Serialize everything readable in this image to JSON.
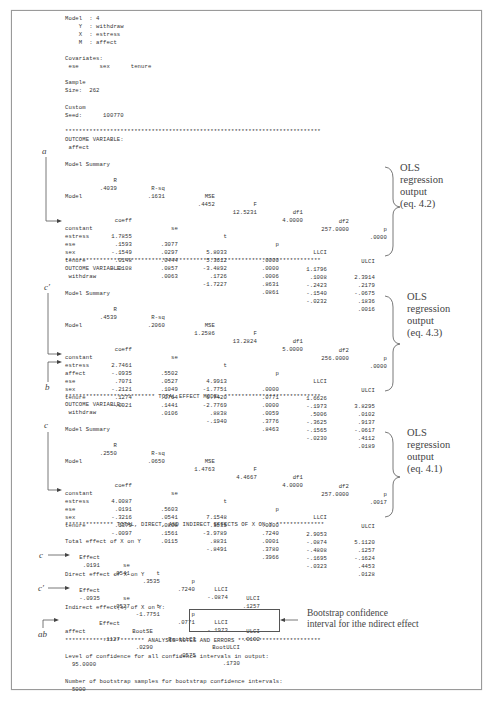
{
  "header": {
    "model_line": "Model  : 4",
    "y_line": "    Y  : withdraw",
    "x_line": "    X  : estress",
    "m_line": "    M  : affect",
    "covariates_label": "Covariates:",
    "covariates": " ese      sex      tenure",
    "sample_label": "Sample",
    "size_line": "Size:  262",
    "custom_label": "Custom",
    "seed_line": "Seed:      100770"
  },
  "stars_plain": "**************************************************************************",
  "outcome_label": "OUTCOME VARIABLE:",
  "model_summary_label": "Model Summary",
  "model_label": "Model",
  "summary_headers": [
    "R",
    "R-sq",
    "MSE",
    "F",
    "df1",
    "df2",
    "p"
  ],
  "coef_headers": [
    "coeff",
    "se",
    "t",
    "p",
    "LLCI",
    "ULCI"
  ],
  "models": [
    {
      "outcome": " affect",
      "summary": [
        ".4039",
        ".1631",
        ".4452",
        "12.5231",
        "4.0000",
        "257.0000",
        ".0000"
      ],
      "rows": [
        [
          "constant",
          "1.7855",
          ".3077",
          "5.8033",
          ".0000",
          "1.1796",
          "2.3914"
        ],
        [
          "estress",
          ".1593",
          ".0297",
          "5.3612",
          ".0000",
          ".1008",
          ".2179"
        ],
        [
          "ese",
          "-.1549",
          ".0444",
          "-3.4892",
          ".0006",
          "-.2423",
          "-.0675"
        ],
        [
          "sex",
          ".0148",
          ".0857",
          ".1726",
          ".8631",
          "-.1540",
          ".1836"
        ],
        [
          "tenure",
          "-.0108",
          ".0063",
          "-1.7227",
          ".0861",
          "-.0232",
          ".0016"
        ]
      ],
      "annotation": [
        "OLS",
        "regression",
        "output",
        "(eq. 4.2)"
      ]
    },
    {
      "outcome": " withdraw",
      "summary": [
        ".4539",
        ".2060",
        "1.2586",
        "13.2824",
        "5.0000",
        "256.0000",
        ".0000"
      ],
      "rows": [
        [
          "constant",
          "2.7461",
          ".5502",
          "4.9913",
          ".0000",
          "1.6626",
          "3.8295"
        ],
        [
          "estress",
          "-.0935",
          ".0527",
          "-1.7751",
          ".0771",
          "-.1973",
          ".0102"
        ],
        [
          "affect",
          ".7071",
          ".1049",
          "6.7420",
          ".0000",
          ".5006",
          ".9137"
        ],
        [
          "ese",
          "-.2121",
          ".0764",
          "-2.7769",
          ".0059",
          "-.3625",
          "-.0617"
        ],
        [
          "sex",
          ".1274",
          ".1441",
          ".8838",
          ".3776",
          "-.1565",
          ".4112"
        ],
        [
          "tenure",
          "-.0021",
          ".0106",
          "-.1940",
          ".8463",
          "-.0230",
          ".0189"
        ]
      ],
      "annotation": [
        "OLS",
        "regression",
        "output",
        "(eq. 4.3)"
      ]
    },
    {
      "title_stars": "************************** TOTAL EFFECT MODEL ****************************",
      "outcome": " withdraw",
      "summary": [
        ".2550",
        ".0650",
        "1.4763",
        "4.4667",
        "4.0000",
        "257.0000",
        ".0017"
      ],
      "rows": [
        [
          "constant",
          "4.0087",
          ".5603",
          "7.1548",
          ".0000",
          "2.9053",
          "5.1120"
        ],
        [
          "estress",
          ".0191",
          ".0541",
          ".3535",
          ".7240",
          "-.0874",
          ".1257"
        ],
        [
          "ese",
          "-.3216",
          ".0808",
          "-3.9789",
          ".0001",
          "-.4808",
          "-.1624"
        ],
        [
          "sex",
          ".1379",
          ".1561",
          ".8831",
          ".3780",
          "-.1695",
          ".4453"
        ],
        [
          "tenure",
          "-.0097",
          ".0115",
          "-.8491",
          ".3966",
          "-.0323",
          ".0128"
        ]
      ],
      "annotation": [
        "OLS",
        "regression",
        "output",
        "(eq. 4.1)"
      ]
    }
  ],
  "effects": {
    "title_stars": "************** TOTAL, DIRECT, AND INDIRECT EFFECTS OF X ON Y **************",
    "total_label": "Total effect of X on Y",
    "direct_label": "Direct effect of X on Y",
    "headers": [
      "Effect",
      "se",
      "t",
      "p",
      "LLCI",
      "ULCI"
    ],
    "total": [
      ".0191",
      ".0541",
      ".3535",
      ".7240",
      "-.0874",
      ".1257"
    ],
    "direct": [
      "-.0935",
      ".0527",
      "-1.7751",
      ".0771",
      "-.1973",
      ".0102"
    ],
    "indirect_label": "Indirect effect(s) of X on Y:",
    "indirect_headers": [
      "Effect",
      "BootSE",
      "BootLLCI",
      "BootULCI"
    ],
    "indirect_row": [
      "affect",
      ".1127",
      ".0290",
      ".0575",
      ".1730"
    ],
    "bootstrap_note_1": "Bootstrap confidence",
    "bootstrap_note_2": "interval for ithe ndirect  effect"
  },
  "notes": {
    "title_stars": "*********************** ANALYSIS NOTES AND ERRORS ************************",
    "confidence_label": "Level of confidence for all confidence intervals in output:",
    "confidence_value": "  95.0000",
    "bootstrap_label": "Number of bootstrap samples for bootstrap confidence intervals:",
    "bootstrap_value": "  5000"
  },
  "path_labels": {
    "a": "a",
    "c_prime": "c′",
    "b": "b",
    "c": "c",
    "ab": "ab"
  }
}
